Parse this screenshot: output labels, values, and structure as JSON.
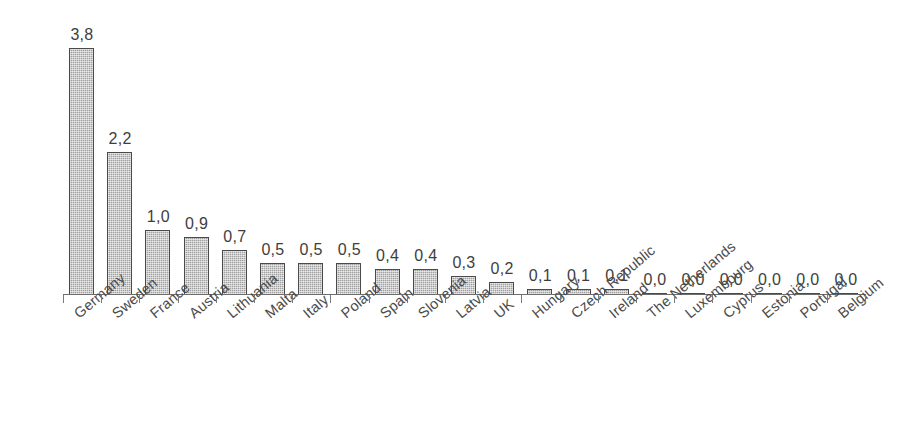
{
  "chart_data": {
    "type": "bar",
    "title": "",
    "subtitle": "",
    "xlabel": "",
    "ylabel": "",
    "ylim": [
      0,
      4.0
    ],
    "grid": false,
    "legend": false,
    "decimal_separator": ",",
    "axis": {
      "visible_axis": "x-only",
      "y_axis_visible": false,
      "ticks_between_categories": true
    },
    "categories": [
      "Germany",
      "Sweden",
      "France",
      "Austria",
      "Lithuania",
      "Malta",
      "Italy",
      "Poland",
      "Spain",
      "Slovenia",
      "Latvia",
      "UK",
      "Hungary",
      "Czech Republic",
      "Ireland",
      "The Netherlands",
      "Luxembourg",
      "Cyprus",
      "Estonia",
      "Portugal",
      "Belgium"
    ],
    "values": [
      3.8,
      2.2,
      1.0,
      0.9,
      0.7,
      0.5,
      0.5,
      0.5,
      0.4,
      0.4,
      0.3,
      0.2,
      0.1,
      0.1,
      0.1,
      0.0,
      0.0,
      0.0,
      0.0,
      0.0,
      0.0
    ],
    "value_labels": [
      "3,8",
      "2,2",
      "1,0",
      "0,9",
      "0,7",
      "0,5",
      "0,5",
      "0,5",
      "0,4",
      "0,4",
      "0,3",
      "0,2",
      "0,1",
      "0,1",
      "0,1",
      "0,0",
      "0,0",
      "0,0",
      "0,0",
      "0,0",
      "0,0"
    ]
  },
  "style": {
    "background_color": "#ffffff",
    "bar_fill_color": "#a0a0a0",
    "bar_border_color": "#4a4a4a",
    "axis_color": "#6e6e6e",
    "text_color": "#3e3e3e"
  }
}
